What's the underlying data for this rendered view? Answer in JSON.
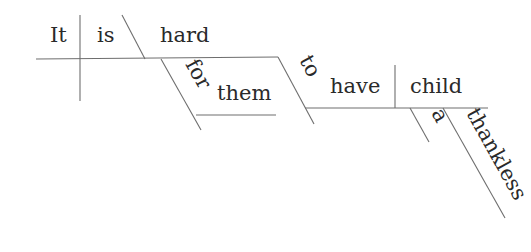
{
  "diagram": {
    "type": "sentence-diagram",
    "sentence": "It is hard for them to have a thankless child",
    "words": {
      "subject": "It",
      "verb": "is",
      "predicate_adjective": "hard",
      "preposition": "for",
      "object_of_preposition": "them",
      "infinitive_marker": "to",
      "infinitive_verb": "have",
      "direct_object": "child",
      "article": "a",
      "adjective": "thankless"
    },
    "line_color": "#6e6e6e",
    "text_color": "#2a2a2a"
  }
}
